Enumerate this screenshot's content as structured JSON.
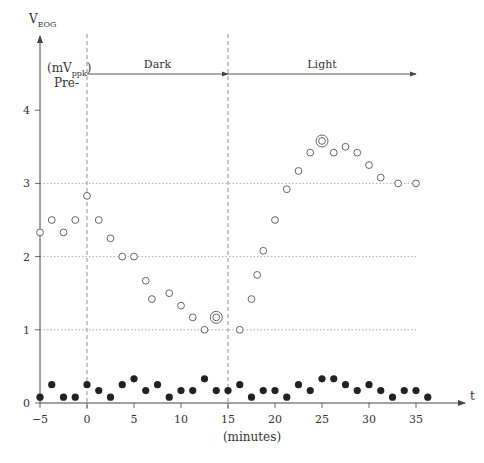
{
  "chart_data": {
    "type": "scatter",
    "title": "",
    "ylabel": "V",
    "ylabel_sub": "EOG",
    "yunit_prefix": "(mV",
    "yunit_sub": "ppk",
    "yunit_suffix": ")",
    "pre_label": "Pre-",
    "xlabel": "(minutes)",
    "xaxis_var": "t",
    "xlim": [
      -5,
      38
    ],
    "ylim": [
      0,
      4.7
    ],
    "xticks": [
      -5,
      0,
      5,
      10,
      15,
      20,
      25,
      30,
      35
    ],
    "yticks": [
      0,
      1,
      2,
      3,
      4
    ],
    "gridlines_y": [
      1,
      2,
      3
    ],
    "phase_boundaries": [
      0,
      15
    ],
    "phases": [
      {
        "label": "Dark",
        "start": 0,
        "end": 15
      },
      {
        "label": "Light",
        "start": 15,
        "end": 35
      }
    ],
    "series": [
      {
        "name": "open-circles",
        "marker": "open",
        "points": [
          [
            -5,
            2.33
          ],
          [
            -3.75,
            2.5
          ],
          [
            -2.5,
            2.33
          ],
          [
            -1.25,
            2.5
          ],
          [
            0,
            2.83
          ],
          [
            1.25,
            2.5
          ],
          [
            2.5,
            2.25
          ],
          [
            3.75,
            2.0
          ],
          [
            5,
            2.0
          ],
          [
            6.25,
            1.67
          ],
          [
            6.9,
            1.42
          ],
          [
            8.75,
            1.5
          ],
          [
            10,
            1.33
          ],
          [
            11.25,
            1.17
          ],
          [
            12.5,
            1.0
          ],
          [
            16.25,
            1.0
          ],
          [
            17.5,
            1.42
          ],
          [
            18.1,
            1.75
          ],
          [
            18.75,
            2.08
          ],
          [
            20,
            2.5
          ],
          [
            21.25,
            2.92
          ],
          [
            22.5,
            3.17
          ],
          [
            23.75,
            3.42
          ],
          [
            26.25,
            3.42
          ],
          [
            27.5,
            3.5
          ],
          [
            28.75,
            3.42
          ],
          [
            30,
            3.25
          ],
          [
            31.25,
            3.08
          ],
          [
            33.1,
            3.0
          ],
          [
            35,
            3.0
          ]
        ]
      },
      {
        "name": "double-circles",
        "marker": "double",
        "points": [
          [
            13.75,
            1.17
          ],
          [
            25,
            3.58
          ]
        ]
      },
      {
        "name": "filled-dots",
        "marker": "filled",
        "points": [
          [
            -5,
            0.08
          ],
          [
            -3.75,
            0.25
          ],
          [
            -2.5,
            0.08
          ],
          [
            -1.25,
            0.08
          ],
          [
            0,
            0.25
          ],
          [
            1.25,
            0.17
          ],
          [
            2.5,
            0.08
          ],
          [
            3.75,
            0.25
          ],
          [
            5,
            0.33
          ],
          [
            6.25,
            0.17
          ],
          [
            7.5,
            0.25
          ],
          [
            8.75,
            0.08
          ],
          [
            10,
            0.17
          ],
          [
            11.25,
            0.17
          ],
          [
            12.5,
            0.33
          ],
          [
            13.75,
            0.17
          ],
          [
            15,
            0.17
          ],
          [
            16.25,
            0.25
          ],
          [
            17.5,
            0.08
          ],
          [
            18.75,
            0.17
          ],
          [
            20,
            0.17
          ],
          [
            21.25,
            0.08
          ],
          [
            22.5,
            0.25
          ],
          [
            23.75,
            0.17
          ],
          [
            25,
            0.33
          ],
          [
            26.25,
            0.33
          ],
          [
            27.5,
            0.25
          ],
          [
            28.75,
            0.17
          ],
          [
            30,
            0.25
          ],
          [
            31.25,
            0.17
          ],
          [
            32.5,
            0.08
          ],
          [
            33.75,
            0.17
          ],
          [
            35,
            0.17
          ],
          [
            36.25,
            0.08
          ]
        ]
      }
    ]
  }
}
